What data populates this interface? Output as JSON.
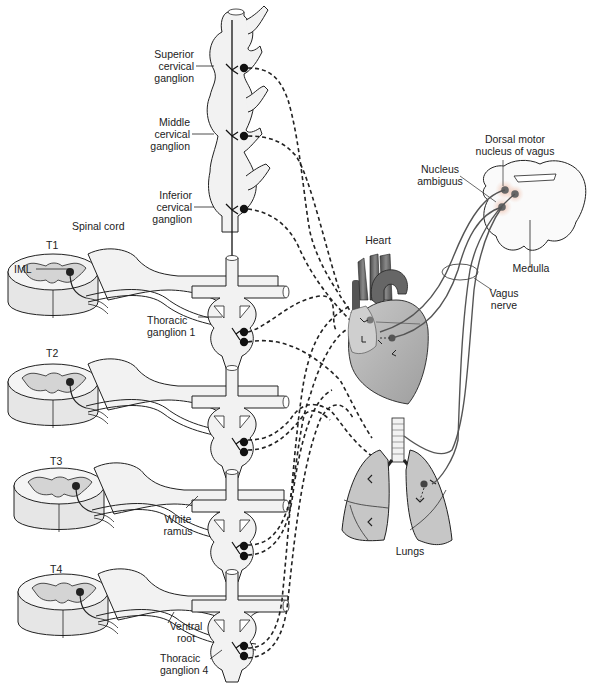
{
  "diagram": {
    "type": "anatomical-illustration",
    "colors": {
      "tissue_fill": "#efefef",
      "grey_matter": "#d8d8d8",
      "organ_fill": "#bdbdbd",
      "organ_dark": "#6f6f6f",
      "nerve_line": "#222222",
      "vagus_line": "#555555",
      "nucleus_glow": "#e8b9a8",
      "nucleus_dot": "#666666"
    },
    "labels": {
      "superior_cervical": "Superior\ncervical\nganglion",
      "middle_cervical": "Middle\ncervical\nganglion",
      "inferior_cervical": "Inferior\ncervical\nganglion",
      "spinal_cord": "Spinal cord",
      "t1": "T1",
      "t2": "T2",
      "t3": "T3",
      "t4": "T4",
      "iml": "IML",
      "thoracic_ganglion_1": "Thoracic\nganglion 1",
      "white_ramus": "White\nramus",
      "ventral_root": "Ventral\nroot",
      "thoracic_ganglion_4": "Thoracic\nganglion 4",
      "heart": "Heart",
      "lungs": "Lungs",
      "nucleus_ambiguus": "Nucleus\nambiguus",
      "dorsal_motor_nucleus": "Dorsal motor\nnucleus of vagus",
      "medulla": "Medulla",
      "vagus_nerve": "Vagus\nnerve"
    },
    "segments": [
      "T1",
      "T2",
      "T3",
      "T4"
    ],
    "cervical_ganglia": [
      "Superior",
      "Middle",
      "Inferior"
    ]
  }
}
